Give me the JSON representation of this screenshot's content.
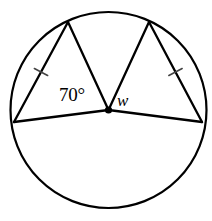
{
  "figure": {
    "type": "geometry-diagram",
    "stroke_color": "#000000",
    "fill_color": "#ffffff",
    "tick_color": "#444444",
    "canvas": {
      "width": 212,
      "height": 221
    }
  },
  "circle": {
    "center_x": 108.5,
    "center_y": 110,
    "radius": 98,
    "stroke_width": 2.2
  },
  "center_point": {
    "label": "center-dot",
    "radius": 3.6
  },
  "vertices": {
    "left": {
      "x": 14,
      "y": 122,
      "name": "left-vertex"
    },
    "top_left": {
      "x": 68,
      "y": 22,
      "name": "top-left-vertex"
    },
    "top_right": {
      "x": 149,
      "y": 22,
      "name": "top-right-vertex"
    },
    "right": {
      "x": 202,
      "y": 122,
      "name": "right-vertex"
    }
  },
  "segments": [
    {
      "name": "radius-to-left-vertex",
      "x1": 108.5,
      "y1": 110,
      "x2": 14,
      "y2": 122
    },
    {
      "name": "radius-to-top-left-vertex",
      "x1": 108.5,
      "y1": 110,
      "x2": 68,
      "y2": 22
    },
    {
      "name": "radius-to-top-right-vertex",
      "x1": 108.5,
      "y1": 110,
      "x2": 149,
      "y2": 22
    },
    {
      "name": "radius-to-right-vertex",
      "x1": 108.5,
      "y1": 110,
      "x2": 202,
      "y2": 122
    },
    {
      "name": "chord-left-upper",
      "x1": 14,
      "y1": 122,
      "x2": 68,
      "y2": 22
    },
    {
      "name": "chord-right-upper",
      "x1": 149,
      "y1": 22,
      "x2": 202,
      "y2": 122
    }
  ],
  "tick_marks": [
    {
      "name": "congruence-tick-left",
      "cx": 41,
      "cy": 72,
      "angle_deg": 28,
      "length": 15
    },
    {
      "name": "congruence-tick-right",
      "cx": 175.5,
      "cy": 72,
      "angle_deg": -28,
      "length": 15
    }
  ],
  "labels": {
    "angle_known": "70°",
    "angle_unknown": "w"
  },
  "chart_data": {
    "type": "diagram",
    "angles": [
      {
        "label": "70°",
        "value": 70,
        "unit": "degrees",
        "known": true
      },
      {
        "label": "w",
        "value": null,
        "unit": "degrees",
        "known": false
      }
    ],
    "congruent_segments": 2
  }
}
